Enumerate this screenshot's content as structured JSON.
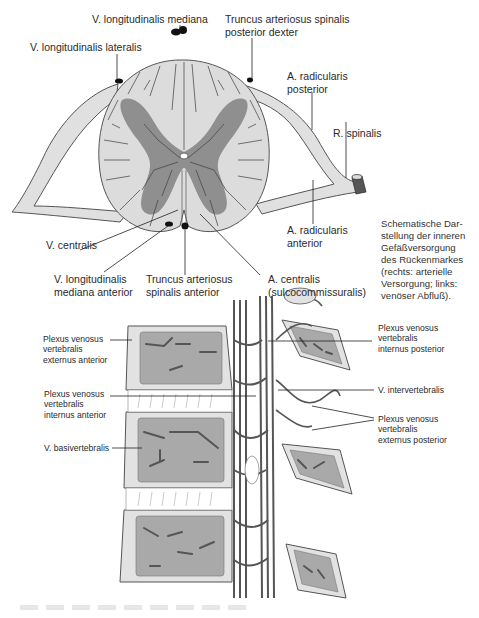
{
  "figure": {
    "caption": "Schematische Dar-\nstellung der inneren\nGefäßversorgung\ndes Rückenmarkes\n(rechts: arterielle\nVersorgung; links:\nvenöser Abfluß).",
    "colors": {
      "white_matter": "#dcdcdc",
      "gray_matter": "#8f8f8f",
      "vessel": "#5a5a5a",
      "bone_outer": "#e2e2e2",
      "bone_inner": "#a9a9a9",
      "outline": "#444444"
    }
  },
  "cross_section": {
    "labels": {
      "v_long_mediana": "V. longitudinalis mediana",
      "truncus_post_dexter": "Truncus arteriosus spinalis\nposterior dexter",
      "v_long_lateralis": "V. longitudinalis lateralis",
      "a_rad_posterior": "A. radicularis\nposterior",
      "r_spinalis": "R. spinalis",
      "a_rad_anterior": "A. radicularis\nanterior",
      "v_centralis": "V. centralis",
      "v_long_med_anterior": "V. longitudinalis\nmediana anterior",
      "truncus_spinalis_anterior": "Truncus arteriosus\nspinalis anterior",
      "a_centralis": "A. centralis\n(sulcocommissuralis)"
    }
  },
  "vertebral_section": {
    "labels": {
      "plexus_ext_ant": "Plexus venosus\nvertebralis\nexternus anterior",
      "plexus_int_ant": "Plexus venosus\nvertebralis\ninternus anterior",
      "v_basivertebralis": "V. basivertebralis",
      "plexus_int_post": "Plexus venosus\nvertebralis\ninternus posterior",
      "v_intervertebralis": "V. intervertebralis",
      "plexus_ext_post": "Plexus venosus\nvertebralis\nexternus posterior"
    }
  }
}
